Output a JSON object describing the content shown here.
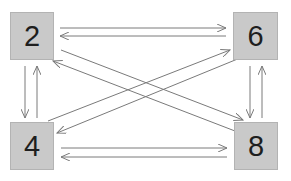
{
  "diagram": {
    "type": "complete-bidirectional-graph",
    "nodes": [
      {
        "id": "n2",
        "label": "2",
        "x": 10,
        "y": 12,
        "w": 44,
        "h": 48
      },
      {
        "id": "n6",
        "label": "6",
        "x": 233,
        "y": 12,
        "w": 45,
        "h": 48
      },
      {
        "id": "n4",
        "label": "4",
        "x": 10,
        "y": 122,
        "w": 44,
        "h": 48
      },
      {
        "id": "n8",
        "label": "8",
        "x": 234,
        "y": 122,
        "w": 44,
        "h": 48
      }
    ],
    "edges": [
      {
        "from": "2",
        "to": "6",
        "x1": 60,
        "y1": 28,
        "x2": 226,
        "y2": 28
      },
      {
        "from": "6",
        "to": "2",
        "x1": 226,
        "y1": 36,
        "x2": 60,
        "y2": 36
      },
      {
        "from": "4",
        "to": "8",
        "x1": 61,
        "y1": 148,
        "x2": 227,
        "y2": 148
      },
      {
        "from": "8",
        "to": "4",
        "x1": 227,
        "y1": 157,
        "x2": 61,
        "y2": 157
      },
      {
        "from": "2",
        "to": "4",
        "x1": 25,
        "y1": 66,
        "x2": 25,
        "y2": 118
      },
      {
        "from": "4",
        "to": "2",
        "x1": 37,
        "y1": 118,
        "x2": 37,
        "y2": 66
      },
      {
        "from": "6",
        "to": "8",
        "x1": 250,
        "y1": 66,
        "x2": 250,
        "y2": 118
      },
      {
        "from": "8",
        "to": "6",
        "x1": 262,
        "y1": 118,
        "x2": 262,
        "y2": 66
      },
      {
        "from": "2",
        "to": "8",
        "x1": 61,
        "y1": 50,
        "x2": 243,
        "y2": 120
      },
      {
        "from": "8",
        "to": "2",
        "x1": 235,
        "y1": 131,
        "x2": 53,
        "y2": 61
      },
      {
        "from": "4",
        "to": "6",
        "x1": 48,
        "y1": 121,
        "x2": 230,
        "y2": 50
      },
      {
        "from": "6",
        "to": "4",
        "x1": 240,
        "y1": 58,
        "x2": 57,
        "y2": 133
      }
    ],
    "colors": {
      "node_fill": "#c9c9c9",
      "node_border": "#b3b3b3",
      "edge": "#7a7a7a",
      "text": "#1e1e1e"
    }
  }
}
